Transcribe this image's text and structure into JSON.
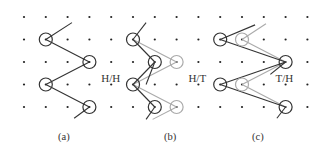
{
  "figure": {
    "grid": {
      "columns": 14,
      "rows": 5,
      "dot_color": "#222222"
    },
    "colors": {
      "dark": "#333333",
      "gray": "#aaaaaa"
    },
    "panels": [
      {
        "id": "a",
        "caption": "(a)",
        "label": "H/H",
        "label_cell": [
          4,
          2
        ],
        "circles": [
          {
            "cell": [
              1,
              1
            ],
            "tone": "dark"
          },
          {
            "cell": [
              3,
              2
            ],
            "tone": "dark"
          },
          {
            "cell": [
              1,
              3
            ],
            "tone": "dark"
          },
          {
            "cell": [
              3,
              4
            ],
            "tone": "dark"
          }
        ],
        "lines": [
          {
            "from": [
              1,
              1
            ],
            "to": [
              2.2,
              0.25
            ],
            "tone": "dark"
          },
          {
            "from": [
              1,
              1
            ],
            "to": [
              3,
              2
            ],
            "tone": "dark"
          },
          {
            "from": [
              1,
              3
            ],
            "to": [
              3,
              2
            ],
            "tone": "dark"
          },
          {
            "from": [
              1,
              3
            ],
            "to": [
              3,
              4
            ],
            "tone": "dark"
          },
          {
            "from": [
              3,
              4
            ],
            "to": [
              2.3,
              4.5
            ],
            "tone": "dark"
          }
        ]
      },
      {
        "id": "b",
        "caption": "(b)",
        "label": "H/T",
        "label_cell": [
          8,
          2
        ],
        "circles": [
          {
            "cell": [
              5,
              1
            ],
            "tone": "dark"
          },
          {
            "cell": [
              6,
              2
            ],
            "tone": "dark"
          },
          {
            "cell": [
              5,
              3
            ],
            "tone": "dark"
          },
          {
            "cell": [
              6,
              4
            ],
            "tone": "dark"
          },
          {
            "cell": [
              7,
              2
            ],
            "tone": "gray"
          },
          {
            "cell": [
              7,
              4
            ],
            "tone": "gray"
          }
        ],
        "lines": [
          {
            "from": [
              5,
              1
            ],
            "to": [
              5.6,
              0.25
            ],
            "tone": "dark"
          },
          {
            "from": [
              5,
              1
            ],
            "to": [
              6,
              2
            ],
            "tone": "dark"
          },
          {
            "from": [
              5,
              1
            ],
            "to": [
              7,
              2
            ],
            "tone": "gray"
          },
          {
            "from": [
              5,
              3
            ],
            "to": [
              6,
              2
            ],
            "tone": "dark"
          },
          {
            "from": [
              5,
              3
            ],
            "to": [
              7,
              2
            ],
            "tone": "gray"
          },
          {
            "from": [
              5,
              3
            ],
            "to": [
              6,
              4
            ],
            "tone": "dark"
          },
          {
            "from": [
              5,
              3
            ],
            "to": [
              7,
              4
            ],
            "tone": "gray"
          },
          {
            "from": [
              6,
              2
            ],
            "to": [
              5.6,
              3.0
            ],
            "tone": "dark"
          },
          {
            "from": [
              6,
              4
            ],
            "to": [
              5.6,
              4.55
            ],
            "tone": "dark"
          },
          {
            "from": [
              7,
              4
            ],
            "to": [
              5.9,
              4.55
            ],
            "tone": "gray"
          }
        ]
      },
      {
        "id": "c",
        "caption": "(c)",
        "label": "T/H",
        "label_cell": [
          12,
          2
        ],
        "circles": [
          {
            "cell": [
              9,
              1
            ],
            "tone": "dark"
          },
          {
            "cell": [
              10,
              1
            ],
            "tone": "gray"
          },
          {
            "cell": [
              12,
              2
            ],
            "tone": "dark"
          },
          {
            "cell": [
              9,
              3
            ],
            "tone": "dark"
          },
          {
            "cell": [
              10,
              3
            ],
            "tone": "gray"
          },
          {
            "cell": [
              12,
              4
            ],
            "tone": "dark"
          }
        ],
        "lines": [
          {
            "from": [
              9,
              1
            ],
            "to": [
              10.6,
              0.35
            ],
            "tone": "dark"
          },
          {
            "from": [
              10,
              1
            ],
            "to": [
              11.1,
              0.3
            ],
            "tone": "gray"
          },
          {
            "from": [
              9,
              1
            ],
            "to": [
              12,
              2
            ],
            "tone": "dark"
          },
          {
            "from": [
              10,
              1
            ],
            "to": [
              12,
              2
            ],
            "tone": "gray"
          },
          {
            "from": [
              9,
              3
            ],
            "to": [
              12,
              2
            ],
            "tone": "dark"
          },
          {
            "from": [
              10,
              3
            ],
            "to": [
              12,
              2
            ],
            "tone": "gray"
          },
          {
            "from": [
              9,
              3
            ],
            "to": [
              12,
              4
            ],
            "tone": "dark"
          },
          {
            "from": [
              10,
              3
            ],
            "to": [
              12,
              4
            ],
            "tone": "gray"
          },
          {
            "from": [
              12,
              2
            ],
            "to": [
              11.3,
              2.55
            ],
            "tone": "dark"
          },
          {
            "from": [
              12,
              4
            ],
            "to": [
              11.6,
              4.5
            ],
            "tone": "dark"
          }
        ]
      }
    ]
  }
}
